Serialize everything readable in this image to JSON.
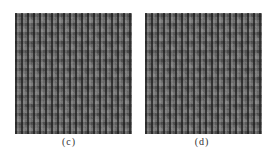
{
  "figure": {
    "panels": [
      {
        "id": "c",
        "label": "(c)",
        "content": "grayscale texture image with vertical stripe pattern"
      },
      {
        "id": "d",
        "label": "(d)",
        "content": "grayscale texture image with vertical stripe pattern"
      }
    ]
  }
}
